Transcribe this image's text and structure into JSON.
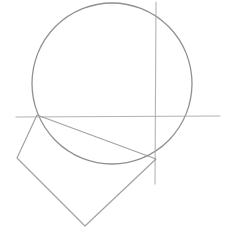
{
  "canvas": {
    "width": 234,
    "height": 249,
    "background_color": "#ffffff",
    "description": "Hand-drawn geometric construction sketch"
  },
  "drawing": {
    "title": "Circle with axes and inscribed quadrilateral",
    "medium": "pencil line drawing",
    "stroke_colors": {
      "circle": "#8a8a8a",
      "axis": "#a6a6a6",
      "quadrilateral": "#999999"
    },
    "shapes": [
      {
        "id": "circle",
        "name": "circle",
        "type": "ellipse",
        "cx": 112,
        "cy": 83.5,
        "rx": 80,
        "ry": 80.5,
        "stroke_width": 1.3,
        "opacity": 0.95
      },
      {
        "id": "horizontal-axis",
        "name": "horizontal axis line",
        "type": "line",
        "x1": 16,
        "y1": 117,
        "x2": 220,
        "y2": 116,
        "stroke_width": 1.1,
        "opacity": 0.85
      },
      {
        "id": "vertical-axis",
        "name": "vertical axis line",
        "type": "line",
        "x1": 156,
        "y1": 2,
        "x2": 155,
        "y2": 184,
        "stroke_width": 1.1,
        "opacity": 0.85
      },
      {
        "id": "quadrilateral",
        "name": "quadrilateral",
        "type": "polygon",
        "points": "37,115 17,158 85,226 156,159",
        "stroke_width": 1.2,
        "opacity": 0.9
      }
    ],
    "vertices": [
      {
        "label": "top vertex",
        "x": 37,
        "y": 115
      },
      {
        "label": "left vertex",
        "x": 17,
        "y": 158
      },
      {
        "label": "bottom vertex",
        "x": 85,
        "y": 226
      },
      {
        "label": "right vertex",
        "x": 156,
        "y": 159
      }
    ],
    "intersections": [
      {
        "label": "left axis-circle crossing",
        "x": 37,
        "y": 116
      },
      {
        "label": "right axis crossing",
        "x": 155,
        "y": 117
      },
      {
        "label": "lower right circle crossing",
        "x": 156,
        "y": 159
      }
    ]
  }
}
